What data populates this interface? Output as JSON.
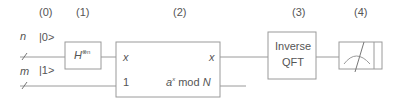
{
  "stages": [
    "(0)",
    "(1)",
    "(2)",
    "(3)",
    "(4)"
  ],
  "registers": {
    "top": {
      "size_label": "n",
      "state": "|0>"
    },
    "bottom": {
      "size_label": "m",
      "state": "|1>"
    }
  },
  "gates": {
    "hadamard": {
      "base": "H",
      "superscript": "⊗n"
    },
    "modexp": {
      "in_top": "x",
      "in_bottom": "1",
      "out_top": "x",
      "out_bottom_prefix": "a",
      "out_bottom_sup": "x",
      "out_bottom_suffix": " mod ",
      "out_bottom_N": "N"
    },
    "qft": {
      "line1": "Inverse",
      "line2": "QFT"
    },
    "measure": {
      "icon": "meter-icon"
    }
  },
  "colors": {
    "line": "#9a9a9a",
    "text": "#555555"
  }
}
